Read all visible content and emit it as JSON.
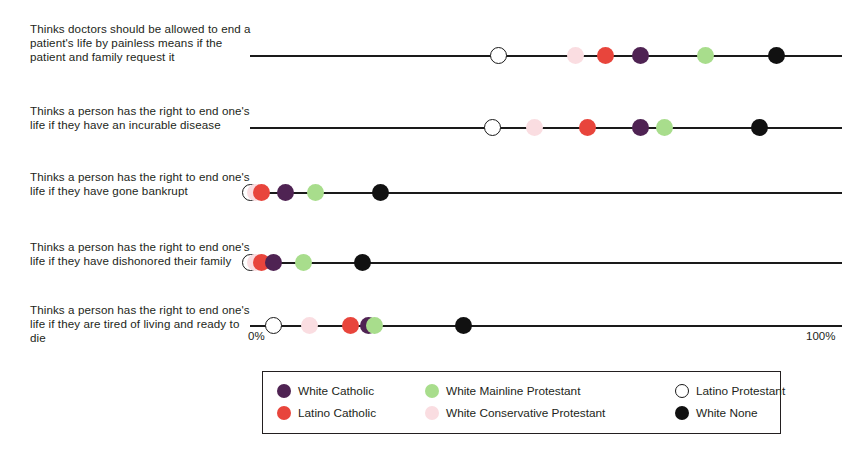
{
  "chart_data": {
    "type": "scatter",
    "title": "",
    "subtitle": "",
    "xlabel": "",
    "ylabel": "",
    "xlim": [
      0,
      100
    ],
    "grid": false,
    "legend_position": "bottom",
    "axis_ticks": {
      "left": "0%",
      "right": "100%"
    },
    "categories": [
      "Thinks doctors should be allowed to end a patient's life by painless means if the patient and family request it",
      "Thinks a person has the right to end one's life if they have an incurable disease",
      "Thinks a person has the right to end one's life if they have gone bankrupt",
      "Thinks a person has the right to end one's life if they have dishonored their family",
      "Thinks a person has the right to end one's life if they are tired of living and ready to die"
    ],
    "series": [
      {
        "name": "White Catholic",
        "color": "#4F2353",
        "values": [
          66,
          66,
          6,
          4,
          20
        ]
      },
      {
        "name": "Latino Catholic",
        "color": "#E8453C",
        "values": [
          60,
          57,
          2,
          2,
          17
        ]
      },
      {
        "name": "White Mainline Protestant",
        "color": "#A8DD8C",
        "values": [
          77,
          70,
          11,
          9,
          21
        ]
      },
      {
        "name": "White Conservative Protestant",
        "color": "#FADDE1",
        "values": [
          55,
          48,
          1,
          1,
          10
        ]
      },
      {
        "name": "Latino Protestant",
        "color": "#FFFFFF",
        "values": [
          42,
          41,
          0,
          0,
          4
        ]
      },
      {
        "name": "White None",
        "color": "#111111",
        "values": [
          89,
          86,
          22,
          19,
          36
        ]
      }
    ]
  },
  "rows": [
    {
      "label": "Thinks doctors should be allowed to end a patient's life by painless means if the patient and family request it"
    },
    {
      "label": "Thinks a person has the right to end one's life if they have an incurable disease"
    },
    {
      "label": "Thinks a person has the right to end one's life if they have gone bankrupt"
    },
    {
      "label": "Thinks a person has the right to end one's life if they have dishonored their family"
    },
    {
      "label": "Thinks a person has the right to end one's life if they are tired of living and ready to die"
    }
  ],
  "axis": {
    "left_tick": "0%",
    "right_tick": "100%"
  },
  "legend": {
    "items": [
      {
        "label": "White Catholic",
        "color": "#4F2353",
        "hollow": false
      },
      {
        "label": "White Mainline Protestant",
        "color": "#A8DD8C",
        "hollow": false
      },
      {
        "label": "Latino Protestant",
        "color": "#FFFFFF",
        "hollow": true
      },
      {
        "label": "Latino Catholic",
        "color": "#E8453C",
        "hollow": false
      },
      {
        "label": "White Conservative Protestant",
        "color": "#FADDE1",
        "hollow": false
      },
      {
        "label": "White None",
        "color": "#111111",
        "hollow": false
      }
    ]
  }
}
